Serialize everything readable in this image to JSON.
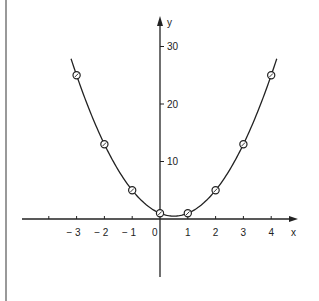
{
  "chart_data": {
    "type": "line",
    "title": "",
    "xlabel": "x",
    "ylabel": "y",
    "xlim": [
      -4.2,
      4.9
    ],
    "ylim": [
      -10,
      31
    ],
    "grid": false,
    "legend": null,
    "x_ticks": [
      -4,
      -3,
      -2,
      -1,
      0,
      1,
      2,
      3,
      4
    ],
    "x_tick_labels": [
      "",
      "− 3",
      "− 2",
      "− 1",
      "0",
      "1",
      "2",
      "3",
      "4"
    ],
    "y_ticks": [
      10,
      20,
      30
    ],
    "y_tick_labels": [
      "10",
      "20",
      "30"
    ],
    "series": [
      {
        "name": "curve",
        "style": "smooth-line",
        "function": "y = 2x^2 - 2x + 1",
        "x_range": [
          -3.2,
          4.2
        ]
      },
      {
        "name": "points",
        "style": "circle-markers",
        "x": [
          -3,
          -2,
          -1,
          0,
          1,
          2,
          3,
          4
        ],
        "y": [
          25,
          13,
          5,
          1,
          1,
          5,
          13,
          25
        ]
      }
    ],
    "colors": {
      "line": "#222222",
      "background": "#ffffff"
    }
  }
}
